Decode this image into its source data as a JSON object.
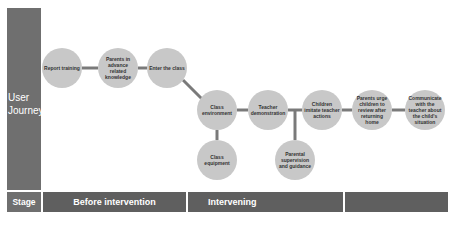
{
  "side_labels": {
    "journey": "User Journey",
    "stage": "Stage"
  },
  "stages": [
    {
      "label": "Before intervention"
    },
    {
      "label": "Intervening"
    },
    {
      "label": ""
    }
  ],
  "nodes": [
    {
      "id": "report-training",
      "label": "Report training"
    },
    {
      "id": "parents-in-advance",
      "label": "Parents in advance related knowledge"
    },
    {
      "id": "enter-class",
      "label": "Enter the class"
    },
    {
      "id": "class-environment",
      "label": "Class environment"
    },
    {
      "id": "teacher-demonstration",
      "label": "Teacher demonstration"
    },
    {
      "id": "children-imitate",
      "label": "Children imitate teacher actions"
    },
    {
      "id": "parents-urge",
      "label": "Parents urge children to review after returning home"
    },
    {
      "id": "communicate-teacher",
      "label": "Communicate with the teacher about the child's situation"
    },
    {
      "id": "class-equipment",
      "label": "Class equipment"
    },
    {
      "id": "parental-supervision",
      "label": "Parental supervision and guidance"
    }
  ],
  "colors": {
    "node_fill": "#c8c8c8",
    "connector": "#7a7a7a",
    "side_panel": "#6f6f6f",
    "stage_bar": "#5f5f5f"
  }
}
